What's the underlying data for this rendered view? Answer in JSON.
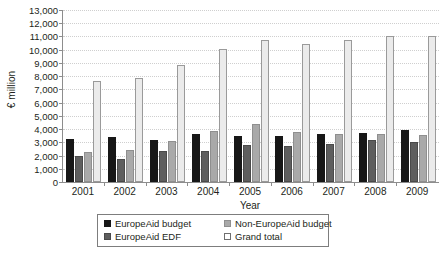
{
  "chart_data": {
    "type": "bar",
    "title": "",
    "xlabel": "Year",
    "ylabel": "€ million",
    "categories": [
      "2001",
      "2002",
      "2003",
      "2004",
      "2005",
      "2006",
      "2007",
      "2008",
      "2009"
    ],
    "ylim": [
      0,
      13000
    ],
    "ytick_step": 1000,
    "yticks": [
      "13,000",
      "12,000",
      "11,000",
      "10,000",
      "9,000",
      "8,000",
      "7,000",
      "6,000",
      "5,000",
      "4,000",
      "3,000",
      "2,000",
      "1,000",
      "0"
    ],
    "ytick_values": [
      13000,
      12000,
      11000,
      10000,
      9000,
      8000,
      7000,
      6000,
      5000,
      4000,
      3000,
      2000,
      1000,
      0
    ],
    "grid": true,
    "legend_position": "bottom-center",
    "series": [
      {
        "name": "EuropeAid budget",
        "color": "#171717",
        "values": [
          3250,
          3400,
          3150,
          3650,
          3500,
          3500,
          3600,
          3700,
          3950
        ]
      },
      {
        "name": "EuropeAid EDF",
        "color": "#5e5e5e",
        "values": [
          2000,
          1750,
          2350,
          2350,
          2800,
          2700,
          2900,
          3150,
          3050
        ]
      },
      {
        "name": "Non-EuropeAid budget",
        "color": "#a9a9a9",
        "values": [
          2250,
          2450,
          3100,
          3850,
          4350,
          3750,
          3600,
          3650,
          3550
        ]
      },
      {
        "name": "Grand total",
        "color": "#ebebeb",
        "values": [
          7600,
          7850,
          8850,
          10050,
          10700,
          10400,
          10700,
          11050,
          11000
        ]
      }
    ]
  },
  "chart": {
    "legend": {
      "items": [
        {
          "label": "EuropeAid budget",
          "swatch": "s0"
        },
        {
          "label": "Non-EuropeAid budget",
          "swatch": "s2"
        },
        {
          "label": "EuropeAid EDF",
          "swatch": "s1"
        },
        {
          "label": "Grand total",
          "swatch": "s3"
        }
      ]
    }
  },
  "caption": ""
}
